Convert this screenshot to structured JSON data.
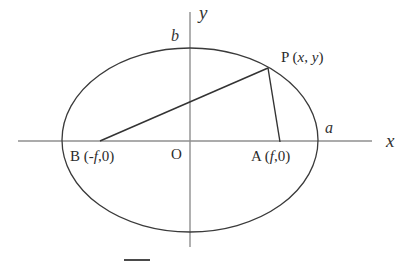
{
  "figure": {
    "type": "geometry-diagram",
    "background_color": "#ffffff",
    "stroke_color": "#3a3a3a",
    "axis_color": "#8f8f8f",
    "chord_color": "#333333",
    "axes": {
      "x_label": "x",
      "y_label": "y",
      "x_line": {
        "x1": 18,
        "y1": 141,
        "x2": 372,
        "y2": 141
      },
      "y_line": {
        "x1": 190,
        "y1": 12,
        "x2": 190,
        "y2": 247
      },
      "x_label_pos": {
        "x": 386,
        "y": 133
      },
      "y_label_pos": {
        "x": 199,
        "y": 5
      }
    },
    "ellipse": {
      "cx": 190,
      "cy": 140,
      "rx": 128,
      "ry": 92,
      "semi_major_label": "a",
      "semi_minor_label": "b",
      "semi_major_label_pos": {
        "x": 325,
        "y": 120
      },
      "semi_minor_label_pos": {
        "x": 172,
        "y": 28
      }
    },
    "origin": {
      "label": "O",
      "pos": {
        "x": 171,
        "y": 147
      }
    },
    "points": [
      {
        "name": "B",
        "label": "B (-f,0)",
        "label_plain": "B (-",
        "label_italic": "f",
        "label_tail": ",0)",
        "coords": {
          "x": 100,
          "y": 141
        },
        "label_pos": {
          "x": 70,
          "y": 149
        }
      },
      {
        "name": "A",
        "label": "A (f,0)",
        "label_plain": "A (",
        "label_italic": "f",
        "label_tail": ",0)",
        "coords": {
          "x": 280,
          "y": 142
        },
        "label_pos": {
          "x": 251,
          "y": 149
        }
      },
      {
        "name": "P",
        "label": "P (x, y)",
        "label_plain": "P (",
        "label_italic_x": "x",
        "label_sep": ", ",
        "label_italic_y": "y",
        "label_tail": ")",
        "coords": {
          "x": 268,
          "y": 68
        },
        "label_pos": {
          "x": 281,
          "y": 50
        }
      }
    ],
    "segments": [
      {
        "name": "BP",
        "x1": 100,
        "y1": 141,
        "x2": 268,
        "y2": 68
      },
      {
        "name": "PA",
        "x1": 268,
        "y1": 68,
        "x2": 280,
        "y2": 142
      }
    ],
    "caption": {
      "text": "",
      "visible": false
    }
  }
}
